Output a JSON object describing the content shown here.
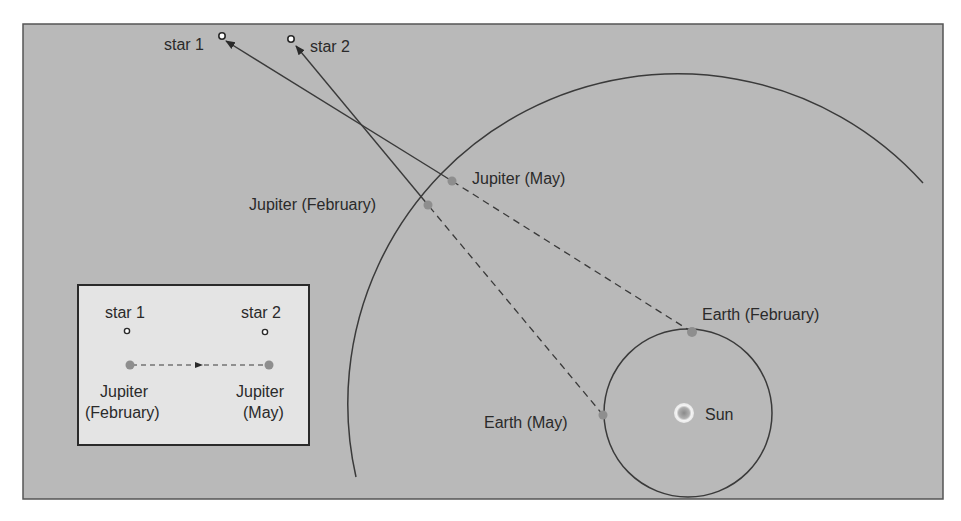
{
  "diagram": {
    "type": "retrograde-motion",
    "colors": {
      "panel_bg": "#b9b9b9",
      "panel_border": "#555555",
      "inset_bg": "#e4e4e4",
      "line": "#3a3a3a",
      "planet": "#8e8e8e",
      "sun_outer": "#f2f2f2",
      "sun_inner": "#9a9a9a"
    },
    "labels": {
      "star1": "star 1",
      "star2": "star 2",
      "jupiter_may": "Jupiter (May)",
      "jupiter_february": "Jupiter (February)",
      "earth_february": "Earth (February)",
      "earth_may": "Earth (May)",
      "sun": "Sun"
    },
    "inset": {
      "star1": "star 1",
      "star2": "star 2",
      "jupiter_feb_line1": "Jupiter",
      "jupiter_feb_line2": "(February)",
      "jupiter_may_line1": "Jupiter",
      "jupiter_may_line2": "(May)"
    }
  }
}
